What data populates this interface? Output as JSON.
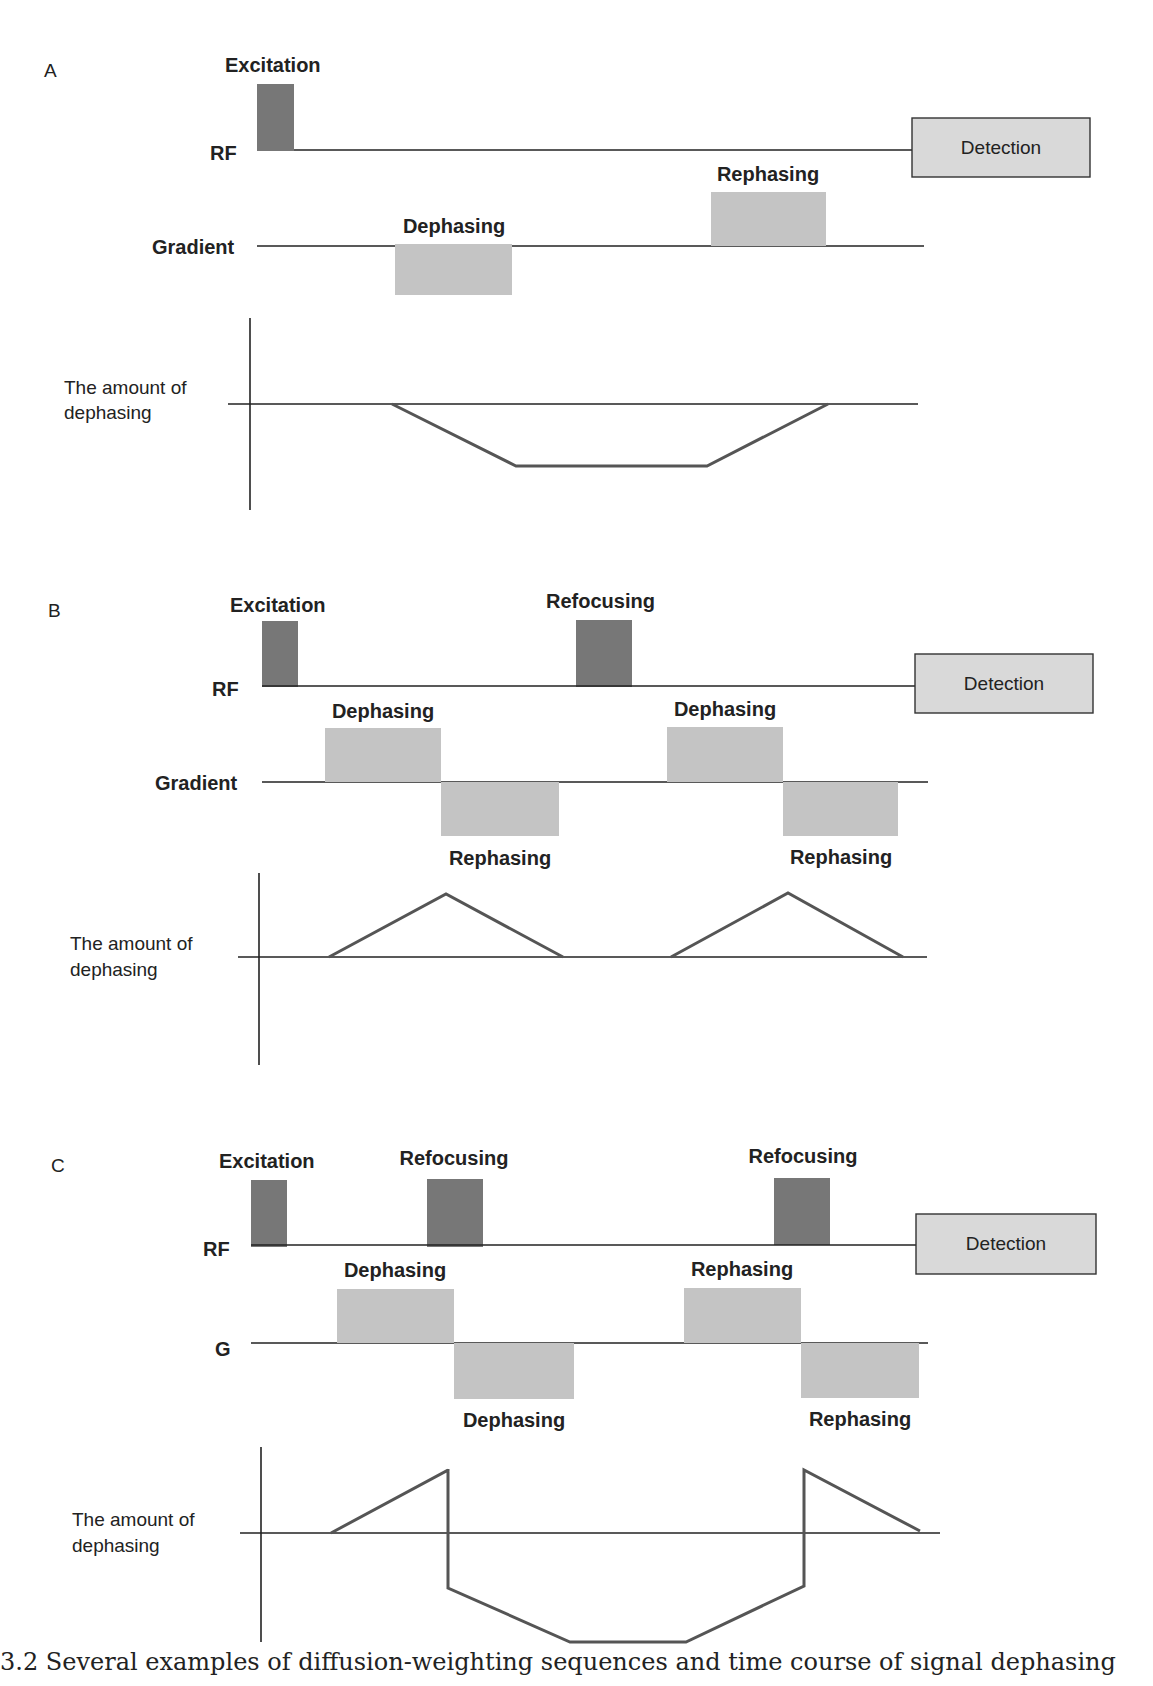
{
  "panels": [
    {
      "letter": "A",
      "rf_label": "RF",
      "gradient_label": "Gradient",
      "amount_label_line1": "The amount of",
      "amount_label_line2": "dephasing",
      "excitation_label": "Excitation",
      "detection_label": "Detection",
      "gradient_pulse_labels": [
        "Dephasing",
        "Rephasing"
      ]
    },
    {
      "letter": "B",
      "rf_label": "RF",
      "gradient_label": "Gradient",
      "amount_label_line1": "The amount of",
      "amount_label_line2": "dephasing",
      "excitation_label": "Excitation",
      "refocusing_label": "Refocusing",
      "detection_label": "Detection",
      "gradient_pulse_labels": [
        "Dephasing",
        "Rephasing",
        "Dephasing",
        "Rephasing"
      ]
    },
    {
      "letter": "C",
      "rf_label": "RF",
      "gradient_label": "G",
      "amount_label_line1": "The amount of",
      "amount_label_line2": "dephasing",
      "excitation_label": "Excitation",
      "refocusing_labels": [
        "Refocusing",
        "Refocusing"
      ],
      "detection_label": "Detection",
      "gradient_pulse_labels": [
        "Dephasing",
        "Dephasing",
        "Rephasing",
        "Rephasing"
      ]
    }
  ],
  "caption": "3.2 Several examples of diffusion-weighting sequences and time course of signal dephasing"
}
